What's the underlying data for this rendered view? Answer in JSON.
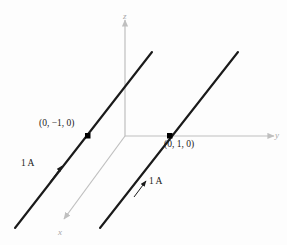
{
  "figure": {
    "type": "physics-vector-diagram",
    "background_color": "#fdfdfd"
  },
  "axes": {
    "color": "#bfbfbf",
    "z": {
      "label": "z",
      "direction": "up",
      "origin": [
        125,
        136
      ],
      "tip": [
        125,
        18
      ]
    },
    "y": {
      "label": "y",
      "direction": "right",
      "origin": [
        125,
        136
      ],
      "tip": [
        277,
        136
      ]
    },
    "x": {
      "label": "x",
      "direction": "down-left",
      "origin": [
        125,
        136
      ],
      "tip": [
        62,
        222
      ]
    }
  },
  "wires": {
    "color": "#1a1a1a",
    "items": [
      {
        "name": "wire-left",
        "coord_label": "(0, −1, 0)",
        "current_label": "1 A",
        "marker_point": [
          88,
          136
        ],
        "start": [
          15,
          228
        ],
        "end": [
          152,
          52
        ],
        "arrow_at": [
          62,
          167
        ]
      },
      {
        "name": "wire-right",
        "coord_label": "(0, 1, 0)",
        "current_label": "1 A",
        "marker_point": [
          170,
          136
        ],
        "start": [
          100,
          228
        ],
        "end": [
          238,
          52
        ],
        "arrow_at": [
          146,
          182
        ]
      }
    ]
  },
  "labels": {
    "coord_left": "(0, −1, 0)",
    "coord_right": "(0, 1, 0)",
    "current_left": "1 A",
    "current_right": "1 A",
    "axis_z": "z",
    "axis_y": "y",
    "axis_x": "x"
  },
  "colors": {
    "wire": "#1a1a1a",
    "axis": "#bfbfbf",
    "marker": "#000000",
    "text": "#1a1a1a",
    "axis_text": "#a8a8a8"
  }
}
